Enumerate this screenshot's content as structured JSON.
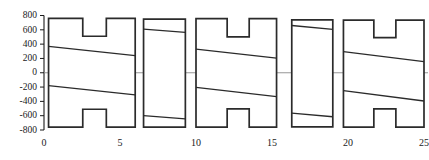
{
  "chart_data": {
    "type": "bar",
    "title": "",
    "subtitle": "",
    "xlabel": "",
    "ylabel": "",
    "xlim": [
      0,
      25
    ],
    "ylim": [
      -800,
      800
    ],
    "grid": false,
    "legend": null,
    "zero_line": true,
    "y_ticks": [
      800,
      600,
      400,
      200,
      0,
      -200,
      -400,
      -600,
      -800
    ],
    "y_tick_labels": [
      "800",
      "600",
      "400",
      "200",
      "0",
      "-200",
      "-400",
      "-600",
      "-800"
    ],
    "x_ticks": [
      0,
      5,
      10,
      15,
      20,
      25
    ],
    "x_tick_labels": [
      "0",
      "5",
      "10",
      "15",
      "20",
      "25"
    ],
    "colors": {
      "outline": "#2b2b2b",
      "trend": "#2b2b2b",
      "axis": "#1a1a1a",
      "zero_line": "#8a8a8a",
      "fill": "#ffffff"
    },
    "glyph_description": "Each group is drawn as a notched H-shaped or plain rectangular envelope spanning an x-interval, with an upper and a lower sloping trend line inside it.",
    "groups": [
      {
        "name": "group-1",
        "shape": "notched-h",
        "x_start": 0.3,
        "x_end": 6.0,
        "notch_x_start": 2.55,
        "notch_x_end": 4.1,
        "top_outer": 760,
        "top_notch": 510,
        "bottom_outer": -760,
        "bottom_notch": -510,
        "upper_line": {
          "y_start": 370,
          "y_end": 240
        },
        "lower_line": {
          "y_start": -180,
          "y_end": -310
        }
      },
      {
        "name": "group-2",
        "shape": "rectangle",
        "x_start": 6.55,
        "x_end": 9.3,
        "notch_x_start": null,
        "notch_x_end": null,
        "top_outer": 750,
        "top_notch": null,
        "bottom_outer": -760,
        "bottom_notch": null,
        "upper_line": {
          "y_start": 610,
          "y_end": 565
        },
        "lower_line": {
          "y_start": -600,
          "y_end": -645
        }
      },
      {
        "name": "group-3",
        "shape": "notched-h",
        "x_start": 10.0,
        "x_end": 15.3,
        "notch_x_start": 12.05,
        "notch_x_end": 13.5,
        "top_outer": 755,
        "top_notch": 500,
        "bottom_outer": -760,
        "bottom_notch": -505,
        "upper_line": {
          "y_start": 330,
          "y_end": 205
        },
        "lower_line": {
          "y_start": -205,
          "y_end": -335
        }
      },
      {
        "name": "group-4",
        "shape": "rectangle",
        "x_start": 16.3,
        "x_end": 19.0,
        "notch_x_start": null,
        "notch_x_end": null,
        "top_outer": 740,
        "top_notch": null,
        "bottom_outer": -755,
        "bottom_notch": null,
        "upper_line": {
          "y_start": 660,
          "y_end": 605
        },
        "lower_line": {
          "y_start": -565,
          "y_end": -615
        }
      },
      {
        "name": "group-5",
        "shape": "notched-h",
        "x_start": 19.7,
        "x_end": 25.0,
        "notch_x_start": 21.7,
        "notch_x_end": 23.15,
        "top_outer": 735,
        "top_notch": 490,
        "bottom_outer": -760,
        "bottom_notch": -505,
        "upper_line": {
          "y_start": 295,
          "y_end": 155
        },
        "lower_line": {
          "y_start": -250,
          "y_end": -395
        }
      }
    ]
  }
}
